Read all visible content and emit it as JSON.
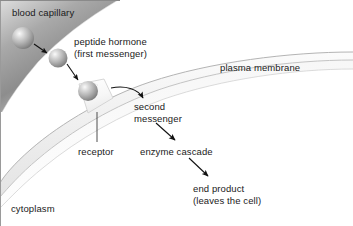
{
  "figure": {
    "width": 353,
    "height": 226,
    "background_color": "#ffffff"
  },
  "labels": {
    "blood_capillary": "blood capillary",
    "peptide_hormone_line1": "peptide hormone",
    "peptide_hormone_line2": "(first messenger)",
    "plasma_membrane": "plasma membrane",
    "second_messenger_line1": "second",
    "second_messenger_line2": "messenger",
    "receptor": "receptor",
    "enzyme_cascade": "enzyme cascade",
    "end_product_line1": "end product",
    "end_product_line2": "(leaves the cell)",
    "cytoplasm": "cytoplasm"
  },
  "colors": {
    "text": "#1a1a1a",
    "arrow": "#111111",
    "capillary_dark": "#8e8e8e",
    "capillary_light": "#e8e8e8",
    "membrane_line": "#b4b4b4",
    "membrane_fill": "#f2f2f2",
    "sphere_highlight": "#f2f2f2",
    "sphere_mid": "#b0b0b0",
    "sphere_dark": "#7d7d7d",
    "receptor_fill": "#fbfbfb",
    "receptor_edge": "#c8c8c8",
    "border": "#9a9a9a"
  },
  "shapes": {
    "hormone_spheres": [
      {
        "name": "sphere-1",
        "cx": 23,
        "cy": 38,
        "r": 11
      },
      {
        "name": "sphere-2",
        "cx": 58,
        "cy": 58,
        "r": 9.5
      },
      {
        "name": "sphere-3",
        "cx": 88,
        "cy": 91,
        "r": 10
      }
    ],
    "arrows": [
      {
        "name": "arrow-sphere1-to-sphere2",
        "from": [
          34,
          44
        ],
        "to": [
          49,
          54
        ]
      },
      {
        "name": "arrow-sphere2-to-sphere3",
        "from": [
          68,
          64
        ],
        "to": [
          80,
          82
        ]
      },
      {
        "name": "arrow-receptor-to-second-messenger",
        "from": [
          110,
          89
        ],
        "to": [
          144,
          99
        ],
        "curved": true
      },
      {
        "name": "arrow-second-messenger-to-enzyme-cascade",
        "from": [
          157,
          124
        ],
        "to": [
          178,
          141
        ]
      },
      {
        "name": "arrow-enzyme-cascade-to-end-product",
        "from": [
          190,
          159
        ],
        "to": [
          211,
          178
        ]
      }
    ],
    "receptor_leader_line": {
      "x": 97,
      "y1": 112,
      "y2": 142
    }
  }
}
